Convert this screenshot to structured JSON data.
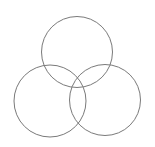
{
  "diagram": {
    "type": "venn-three-circles",
    "background": "#ffffff",
    "stroke_color": "#7a7a7a",
    "stroke_width": 1,
    "circles": [
      {
        "name": "top",
        "cx": 77,
        "cy": 52,
        "r": 35.5
      },
      {
        "name": "bottom-left",
        "cx": 50,
        "cy": 101,
        "r": 36
      },
      {
        "name": "bottom-right",
        "cx": 105,
        "cy": 100,
        "r": 35.5
      }
    ]
  }
}
